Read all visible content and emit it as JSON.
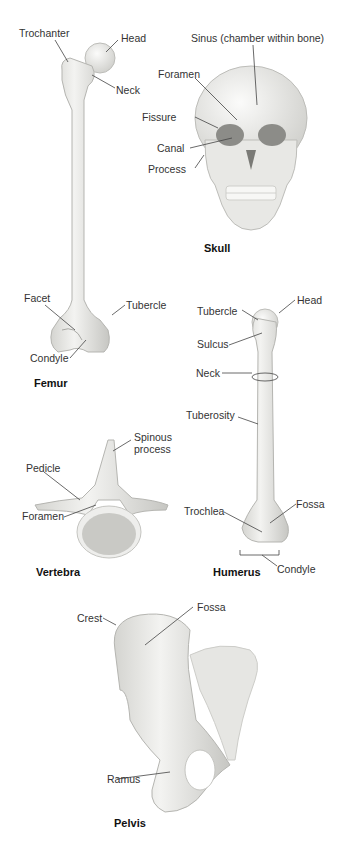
{
  "colors": {
    "bone": "#ececea",
    "bone_shade": "#c9c9c5",
    "bone_dark": "#9a9a96",
    "leader": "#444444",
    "background": "#ffffff"
  },
  "femur": {
    "title": "Femur",
    "labels": {
      "trochanter": "Trochanter",
      "head": "Head",
      "neck": "Neck",
      "facet": "Facet",
      "tubercle": "Tubercle",
      "condyle": "Condyle"
    }
  },
  "skull": {
    "title": "Skull",
    "labels": {
      "sinus": "Sinus (chamber within bone)",
      "foramen": "Foramen",
      "fissure": "Fissure",
      "canal": "Canal",
      "process": "Process"
    }
  },
  "humerus": {
    "title": "Humerus",
    "labels": {
      "tubercle": "Tubercle",
      "head": "Head",
      "sulcus": "Sulcus",
      "neck": "Neck",
      "tuberosity": "Tuberosity",
      "trochlea": "Trochlea",
      "fossa": "Fossa",
      "condyle": "Condyle"
    }
  },
  "vertebra": {
    "title": "Vertebra",
    "labels": {
      "spinous_process_1": "Spinous",
      "spinous_process_2": "process",
      "pedicle": "Pedicle",
      "foramen": "Foramen"
    }
  },
  "pelvis": {
    "title": "Pelvis",
    "labels": {
      "crest": "Crest",
      "fossa": "Fossa",
      "ramus": "Ramus"
    }
  }
}
